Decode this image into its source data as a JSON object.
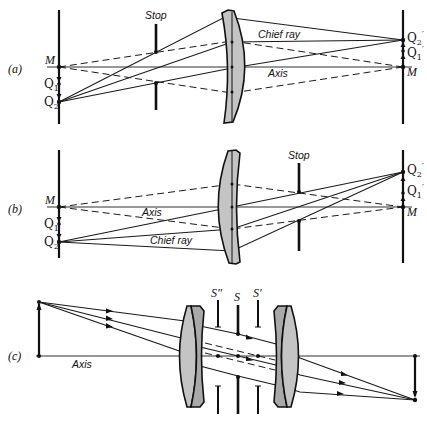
{
  "panels": {
    "a": {
      "label": "(a)",
      "object_labels": {
        "M": "M",
        "Q1": "Q",
        "Q1_sub": "1",
        "Q2": "Q",
        "Q2_sub": "2"
      },
      "image_labels": {
        "M": "M",
        "Q1p": "Q",
        "Q1p_sub": "1",
        "Q2p": "Q",
        "Q2p_sub": "2",
        "prime": "′"
      },
      "stop_label": "Stop",
      "chief_ray_label": "Chief ray",
      "axis_label": "Axis"
    },
    "b": {
      "label": "(b)",
      "object_labels": {
        "M": "M",
        "Q1": "Q",
        "Q1_sub": "1",
        "Q2": "Q",
        "Q2_sub": "2"
      },
      "image_labels": {
        "M": "M",
        "Q1p": "Q",
        "Q1p_sub": "1",
        "Q2p": "Q",
        "Q2p_sub": "2",
        "prime": "′"
      },
      "stop_label": "Stop",
      "chief_ray_label": "Chief ray",
      "axis_label": "Axis"
    },
    "c": {
      "label": "(c)",
      "axis_label": "Axis",
      "stop_labels": {
        "s_double_prime": "S″",
        "s": "S",
        "s_prime": "S′"
      }
    }
  }
}
